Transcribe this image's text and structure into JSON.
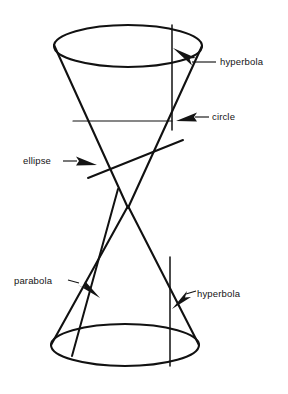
{
  "figure": {
    "background_color": "#ffffff",
    "ink_color": "#111111",
    "width": 288,
    "height": 394
  },
  "labels": {
    "hyperbola_top": "hyperbola",
    "circle": "circle",
    "ellipse": "ellipse",
    "parabola": "parabola",
    "hyperbola_bottom": "hyperbola"
  },
  "shapes": {
    "upper_cone": {
      "name": "upper-nappe",
      "rim_center": [
        128,
        46
      ],
      "rim_rx": 74,
      "rim_ry": 21,
      "apex": [
        128,
        207
      ]
    },
    "lower_cone": {
      "name": "lower-nappe",
      "rim_center": [
        125,
        345
      ],
      "rim_rx": 74,
      "rim_ry": 21,
      "apex": [
        128,
        207
      ]
    },
    "cuts": [
      {
        "name": "circle-cut",
        "kind": "horizontal",
        "from": [
          73,
          121
        ],
        "to": [
          172,
          121
        ]
      },
      {
        "name": "ellipse-cut",
        "kind": "oblique",
        "from": [
          89,
          177
        ],
        "to": [
          182,
          141
        ]
      },
      {
        "name": "parabola-cut",
        "kind": "oblique-steep",
        "from": [
          118,
          190
        ],
        "to": [
          73,
          355
        ]
      },
      {
        "name": "hyperbola-cut-upper",
        "kind": "vertical",
        "from": [
          172,
          25
        ],
        "to": [
          172,
          130
        ]
      },
      {
        "name": "hyperbola-cut-lower",
        "kind": "vertical",
        "from": [
          170,
          258
        ],
        "to": [
          170,
          365
        ]
      }
    ]
  }
}
